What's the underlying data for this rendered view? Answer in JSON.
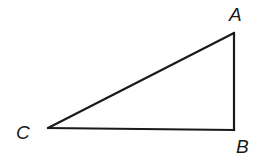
{
  "diagram": {
    "type": "right-triangle",
    "stroke_color": "#1a1a1a",
    "fill_color": "#ffffff",
    "vertices": [
      {
        "name": "A",
        "label": "A",
        "x": 234,
        "y": 33,
        "label_x": 229,
        "label_y": 5
      },
      {
        "name": "B",
        "label": "B",
        "x": 234,
        "y": 130,
        "label_x": 236,
        "label_y": 137
      },
      {
        "name": "C",
        "label": "C",
        "x": 48,
        "y": 128,
        "label_x": 16,
        "label_y": 123
      }
    ],
    "right_angle_at": "B",
    "sides": [
      {
        "name": "AB",
        "from": "A",
        "to": "B"
      },
      {
        "name": "BC",
        "from": "B",
        "to": "C"
      },
      {
        "name": "CA",
        "from": "C",
        "to": "A"
      }
    ]
  }
}
